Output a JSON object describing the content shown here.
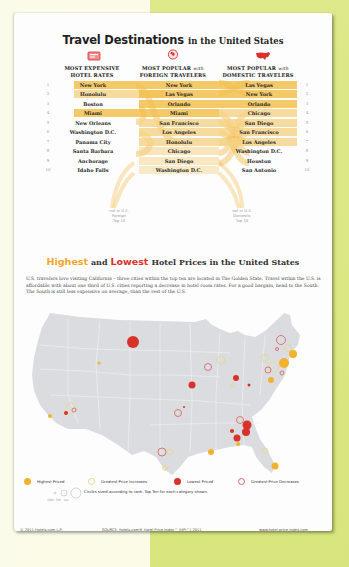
{
  "infographic": {
    "section1": {
      "title_bold": "Travel Destinations",
      "title_rest": "in the United States",
      "columns": [
        {
          "icon": "hotel-price-tag-icon",
          "line1": "MOST EXPENSIVE",
          "line2": "HOTEL RATES"
        },
        {
          "icon": "globe-icon",
          "line1": "MOST POPULAR",
          "line1_suffix": "with",
          "line2": "FOREIGN TRAVELERS"
        },
        {
          "icon": "us-map-icon",
          "line1": "MOST POPULAR",
          "line1_suffix": "with",
          "line2": "DOMESTIC TRAVELERS"
        }
      ],
      "notes": {
        "foreign": [
          "not in U.S.",
          "Foreign",
          "Top 10"
        ],
        "domestic": [
          "not in U.S.",
          "Domestic",
          "Top 10"
        ]
      }
    },
    "section2": {
      "title_highest": "Highest",
      "title_and": "and",
      "title_lowest": "Lowest",
      "title_rest": "Hotel Prices in the United States",
      "intro": "U.S. travelers love visiting California – three cities within the top ten are located in The Golden State. Travel within the U.S. is affordable with about one third of U.S. cities reporting a decrease in hotel room rates. For a good bargain, head to the South. The South is still less expensive on average, than the rest of the U.S."
    },
    "legend": {
      "items": [
        {
          "label": "Highest Priced",
          "type": "filled",
          "color": "#f2b12e"
        },
        {
          "label": "Greatest Price Increases",
          "type": "ring",
          "color": "#e9dd9a"
        },
        {
          "label": "Lowest Priced",
          "type": "filled",
          "color": "#d8322b"
        },
        {
          "label": "Greatest Price Decreases",
          "type": "ring",
          "color": "#d86a6a"
        }
      ],
      "size_note": "Circles sized according to rank. Top Ten for each category shown.",
      "size_labels": [
        "10th",
        "5th",
        "1st"
      ]
    },
    "footer": {
      "copyright": "© 2011 Hotels.com L.P.",
      "source": "SOURCE: hotels.com® Hotel Price Index™ (HPI™) 2011",
      "url": "www.hotel-price-index.com"
    }
  },
  "chart_data": [
    {
      "type": "table",
      "title": "Travel Destinations in the United States",
      "rank": [
        1,
        2,
        3,
        4,
        5,
        6,
        7,
        8,
        9,
        10
      ],
      "series": [
        {
          "name": "MOST EXPENSIVE HOTEL RATES",
          "values": [
            "New York",
            "Honolulu",
            "Boston",
            "Miami",
            "New Orleans",
            "Washington D.C.",
            "Panama City",
            "Santa Barbara",
            "Anchorage",
            "Idaho Falls"
          ]
        },
        {
          "name": "MOST POPULAR with FOREIGN TRAVELERS",
          "values": [
            "New York",
            "Las Vegas",
            "Orlando",
            "Miami",
            "San Francisco",
            "Los Angeles",
            "Honolulu",
            "Chicago",
            "San Diego",
            "Washington D.C."
          ]
        },
        {
          "name": "MOST POPULAR with DOMESTIC TRAVELERS",
          "values": [
            "Las Vegas",
            "New York",
            "Orlando",
            "Chicago",
            "San Diego",
            "San Francisco",
            "Los Angeles",
            "Washington D.C.",
            "Houston",
            "San Antonio"
          ]
        }
      ],
      "highlighted_rows": {
        "expensive": [
          1,
          2,
          4
        ],
        "foreign": [
          1,
          2,
          3,
          4,
          5,
          6,
          7,
          8,
          9,
          10
        ],
        "domestic": [
          1,
          2,
          3,
          4,
          5,
          6,
          7
        ]
      }
    },
    {
      "type": "scatter",
      "title": "Highest and Lowest Hotel Prices in the United States",
      "xlabel": "",
      "ylabel": "",
      "legend": [
        "Highest Priced",
        "Greatest Price Increases",
        "Lowest Priced",
        "Greatest Price Decreases"
      ],
      "points": [
        {
          "x": 113,
          "y": 37,
          "r": 6,
          "cat": "Lowest Priced"
        },
        {
          "x": 79,
          "y": 58,
          "r": 1.5,
          "cat": "Highest Priced"
        },
        {
          "x": 51,
          "y": 103,
          "r": 5,
          "cat": "Greatest Price Increases"
        },
        {
          "x": 54,
          "y": 105,
          "r": 2,
          "cat": "Greatest Price Decreases"
        },
        {
          "x": 46,
          "y": 108,
          "r": 2,
          "cat": "Lowest Priced"
        },
        {
          "x": 30,
          "y": 111,
          "r": 2,
          "cat": "Highest Priced"
        },
        {
          "x": 158,
          "y": 108,
          "r": 3.5,
          "cat": "Greatest Price Decreases"
        },
        {
          "x": 164,
          "y": 102,
          "r": 1,
          "cat": "Lowest Priced"
        },
        {
          "x": 172,
          "y": 80,
          "r": 3.5,
          "cat": "Lowest Priced"
        },
        {
          "x": 188,
          "y": 62,
          "r": 3.5,
          "cat": "Greatest Price Decreases"
        },
        {
          "x": 201,
          "y": 55,
          "r": 4,
          "cat": "Greatest Price Increases"
        },
        {
          "x": 216,
          "y": 73,
          "r": 3,
          "cat": "Lowest Priced"
        },
        {
          "x": 213,
          "y": 80,
          "r": 2,
          "cat": "Greatest Price Increases"
        },
        {
          "x": 229,
          "y": 80,
          "r": 1.5,
          "cat": "Lowest Priced"
        },
        {
          "x": 261,
          "y": 35,
          "r": 4.5,
          "cat": "Greatest Price Decreases"
        },
        {
          "x": 257,
          "y": 44,
          "r": 1.5,
          "cat": "Greatest Price Decreases"
        },
        {
          "x": 268,
          "y": 43,
          "r": 3.5,
          "cat": "Greatest Price Increases"
        },
        {
          "x": 273,
          "y": 49,
          "r": 4,
          "cat": "Highest Priced"
        },
        {
          "x": 245,
          "y": 53,
          "r": 3.5,
          "cat": "Greatest Price Increases"
        },
        {
          "x": 264,
          "y": 58,
          "r": 5,
          "cat": "Highest Priced"
        },
        {
          "x": 254,
          "y": 62,
          "r": 5,
          "cat": "Greatest Price Increases"
        },
        {
          "x": 248,
          "y": 65,
          "r": 3,
          "cat": "Greatest Price Decreases"
        },
        {
          "x": 262,
          "y": 68,
          "r": 2,
          "cat": "Greatest Price Decreases"
        },
        {
          "x": 251,
          "y": 75,
          "r": 3,
          "cat": "Highest Priced"
        },
        {
          "x": 220,
          "y": 115,
          "r": 3.5,
          "cat": "Greatest Price Decreases"
        },
        {
          "x": 227,
          "y": 120,
          "r": 4.5,
          "cat": "Lowest Priced"
        },
        {
          "x": 226,
          "y": 127,
          "r": 4,
          "cat": "Lowest Priced"
        },
        {
          "x": 212,
          "y": 126,
          "r": 2,
          "cat": "Lowest Priced"
        },
        {
          "x": 217,
          "y": 133,
          "r": 3.5,
          "cat": "Lowest Priced"
        },
        {
          "x": 218,
          "y": 139,
          "r": 2,
          "cat": "Highest Priced"
        },
        {
          "x": 191,
          "y": 147,
          "r": 3,
          "cat": "Highest Priced"
        },
        {
          "x": 142,
          "y": 147,
          "r": 4,
          "cat": "Greatest Price Decreases"
        },
        {
          "x": 150,
          "y": 147,
          "r": 3,
          "cat": "Greatest Price Increases"
        },
        {
          "x": 145,
          "y": 163,
          "r": 2.5,
          "cat": "Greatest Price Increases"
        },
        {
          "x": 245,
          "y": 146,
          "r": 3,
          "cat": "Greatest Price Increases"
        },
        {
          "x": 255,
          "y": 161,
          "r": 3.5,
          "cat": "Highest Priced"
        }
      ]
    }
  ]
}
